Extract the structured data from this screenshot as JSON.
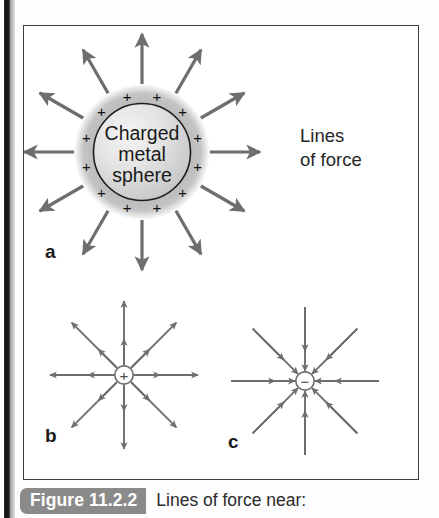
{
  "figure": {
    "caption_tag": "Figure 11.2.2",
    "caption_text": "Lines of force near:",
    "panels": [
      {
        "letter": "a",
        "sphere_label_lines": [
          "Charged",
          "metal",
          "sphere"
        ],
        "annotation_lines": [
          "Lines",
          "of force"
        ],
        "charge_symbol": "+",
        "charge_count": 12,
        "field_line_count": 12,
        "field_direction": "outward"
      },
      {
        "letter": "b",
        "charge_symbol": "+",
        "field_line_count": 8,
        "field_direction": "outward"
      },
      {
        "letter": "c",
        "charge_symbol": "−",
        "field_line_count": 8,
        "field_direction": "inward"
      }
    ]
  },
  "colors": {
    "arrow_gray": "#6e6e6e",
    "halo_gray": "#b9b9b9",
    "sphere_light": "#efefef",
    "sphere_mid": "#d2d2d2",
    "caption_tag_bg": "#8a8a8a",
    "frame_border": "#3c3c3c",
    "text_dark": "#1a1a1a"
  },
  "chart_data": {
    "type": "diagram",
    "title": "Figure 11.2.2 Lines of force near:",
    "panel_a": {
      "label": "a",
      "object": "Charged metal sphere",
      "surface_charges": "+",
      "surface_charge_count": 12,
      "field_lines": 12,
      "field_direction": "radially outward",
      "annotation": "Lines of force",
      "line_angles_deg": [
        90,
        60,
        30,
        0,
        330,
        300,
        270,
        240,
        210,
        180,
        150,
        120
      ],
      "charge_angles_deg": [
        75,
        45,
        15,
        345,
        315,
        285,
        255,
        225,
        195,
        165,
        135,
        105
      ]
    },
    "panel_b": {
      "label": "b",
      "object": "Point positive charge",
      "charge_symbol": "+",
      "field_lines": 8,
      "field_direction": "radially outward",
      "line_angles_deg": [
        0,
        45,
        90,
        135,
        180,
        225,
        270,
        315
      ]
    },
    "panel_c": {
      "label": "c",
      "object": "Point negative charge",
      "charge_symbol": "−",
      "field_lines": 8,
      "field_direction": "radially inward",
      "line_angles_deg": [
        0,
        45,
        90,
        135,
        180,
        225,
        270,
        315
      ]
    }
  }
}
